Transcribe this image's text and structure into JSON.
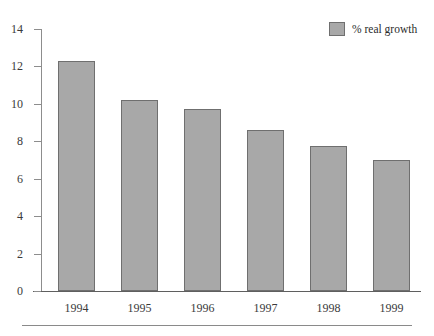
{
  "figure": {
    "caption_sliver": "",
    "background": "#ffffff"
  },
  "legend": {
    "position": "top-right",
    "label": "% real growth",
    "swatch_color": "#a8a8a8",
    "swatch_border": "#6f6f6f"
  },
  "axis": {
    "y_ticks": [
      "0",
      "2",
      "4",
      "6",
      "8",
      "10",
      "12",
      "14"
    ],
    "x_ticks": [
      "1994",
      "1995",
      "1996",
      "1997",
      "1998",
      "1999"
    ]
  },
  "chart_data": {
    "type": "bar",
    "title": "",
    "subtitle": "",
    "xlabel": "",
    "ylabel": "",
    "categories": [
      "1994",
      "1995",
      "1996",
      "1997",
      "1998",
      "1999"
    ],
    "values": [
      12.3,
      10.2,
      9.7,
      8.6,
      7.75,
      7.0
    ],
    "series": [
      {
        "name": "% real growth",
        "values": [
          12.3,
          10.2,
          9.7,
          8.6,
          7.75,
          7.0
        ],
        "color": "#a8a8a8"
      }
    ],
    "ylim": [
      0,
      14
    ],
    "ytick_step": 2,
    "ytick_values": [
      0,
      2,
      4,
      6,
      8,
      10,
      12,
      14
    ],
    "grid": false,
    "legend_position": "top-right",
    "bar_color": "#a8a8a8",
    "bar_edge_color": "#6f6f6f",
    "axis_color": "#8d8d8d",
    "annotations": []
  }
}
